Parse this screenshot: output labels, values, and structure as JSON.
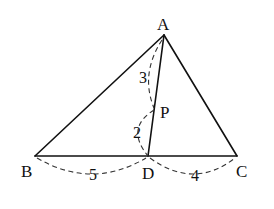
{
  "diagram": {
    "type": "triangle-geometry",
    "points": {
      "A": {
        "label": "A",
        "x": 164,
        "y": 35
      },
      "B": {
        "label": "B",
        "x": 35,
        "y": 156
      },
      "C": {
        "label": "C",
        "x": 237,
        "y": 156
      },
      "D": {
        "label": "D",
        "x": 148,
        "y": 156
      },
      "P": {
        "label": "P",
        "x": 154,
        "y": 108
      }
    },
    "segments": [
      {
        "from": "A",
        "to": "B",
        "style": "solid"
      },
      {
        "from": "A",
        "to": "C",
        "style": "solid"
      },
      {
        "from": "B",
        "to": "C",
        "style": "solid"
      },
      {
        "from": "A",
        "to": "D",
        "style": "solid"
      }
    ],
    "measurements": {
      "AP": "3",
      "PD": "2",
      "BD": "5",
      "DC": "4"
    }
  }
}
